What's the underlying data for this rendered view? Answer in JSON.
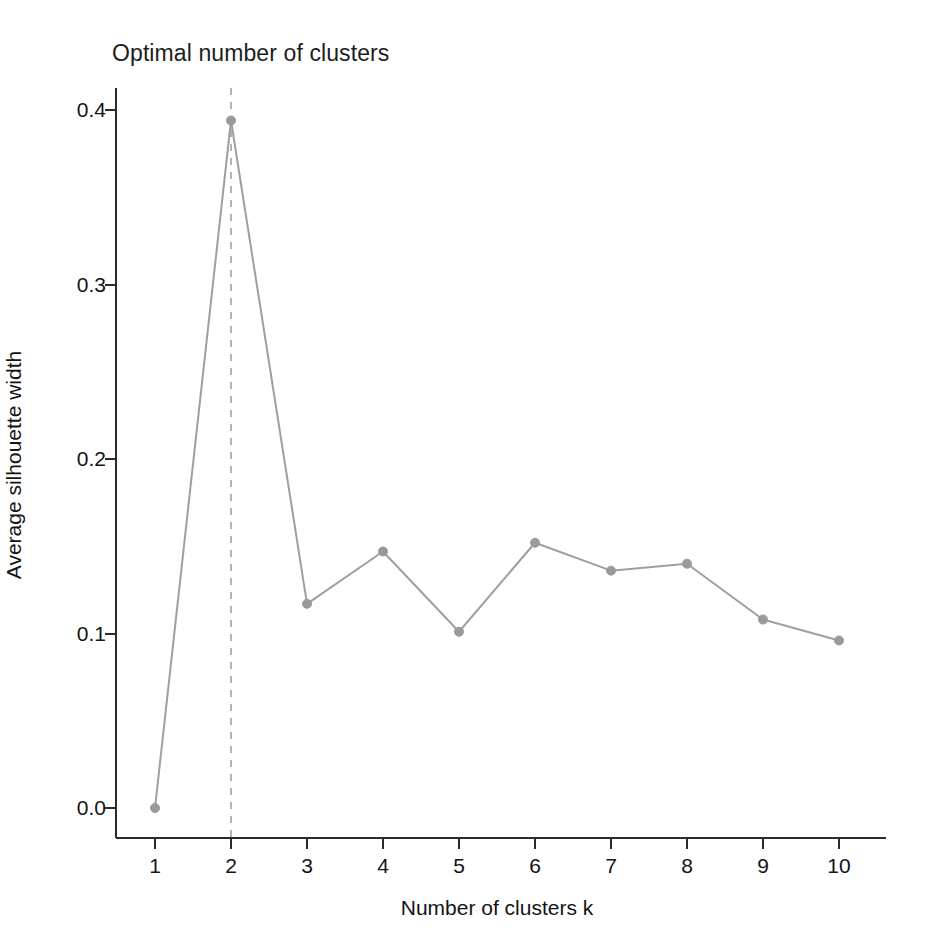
{
  "chart_data": {
    "type": "line",
    "title": "Optimal number of clusters",
    "xlabel": "Number of clusters k",
    "ylabel": "Average silhouette width",
    "x": [
      1,
      2,
      3,
      4,
      5,
      6,
      7,
      8,
      9,
      10
    ],
    "categories": [
      "1",
      "2",
      "3",
      "4",
      "5",
      "6",
      "7",
      "8",
      "9",
      "10"
    ],
    "values": [
      0.0,
      0.394,
      0.117,
      0.147,
      0.101,
      0.152,
      0.136,
      0.14,
      0.108,
      0.096
    ],
    "series": [
      {
        "name": "Average silhouette width",
        "values": [
          0.0,
          0.394,
          0.117,
          0.147,
          0.101,
          0.152,
          0.136,
          0.14,
          0.108,
          0.096
        ]
      }
    ],
    "xlim": [
      0.5,
      10.5
    ],
    "ylim": [
      0.0,
      0.41
    ],
    "xticks": [
      1,
      2,
      3,
      4,
      5,
      6,
      7,
      8,
      9,
      10
    ],
    "xtick_labels": [
      "1",
      "2",
      "3",
      "4",
      "5",
      "6",
      "7",
      "8",
      "9",
      "10"
    ],
    "yticks": [
      0.0,
      0.1,
      0.2,
      0.3,
      0.4
    ],
    "ytick_labels": [
      "0.0",
      "0.1",
      "0.2",
      "0.3",
      "0.4"
    ],
    "grid": false,
    "legend": "none",
    "annotations": [
      {
        "type": "vertical-dashed-line",
        "x": 2,
        "label": "optimal k marker"
      }
    ],
    "colors": {
      "line": "#9f9f9f",
      "marker": "#9a9a9a",
      "vline": "#b4b4b4",
      "axis": "#2b2b2b",
      "text": "#141414",
      "background": "#ffffff"
    },
    "marker": "circle",
    "marker_size": 9,
    "line_width": 2
  }
}
